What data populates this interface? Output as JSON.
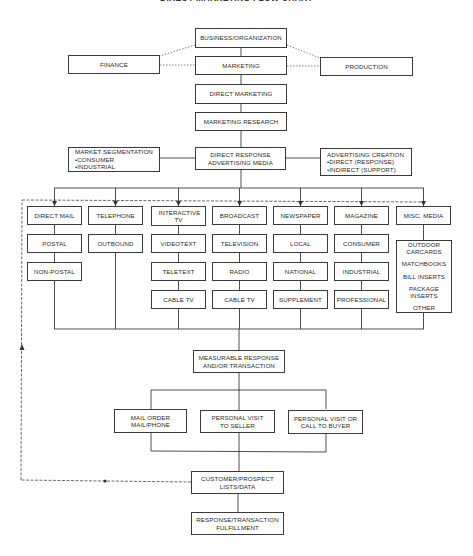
{
  "title": "DIRECT MARKETING FLOW CHART",
  "top_chain": {
    "business": "BUSINESS/ORGANIZATION",
    "finance": "FINANCE",
    "marketing": "MARKETING",
    "production": "PRODUCTION",
    "direct_marketing": "DIRECT MARKETING",
    "marketing_research": "MARKETING RESEARCH"
  },
  "media_row": {
    "center_line1": "DIRECT RESPONSE",
    "center_line2": "ADVERTISING MEDIA",
    "segmentation": {
      "title": "MARKET SEGMENTATION",
      "items": [
        "CONSUMER",
        "INDUSTRIAL"
      ]
    },
    "creation": {
      "title": "ADVERTISING CREATION",
      "items": [
        "DIRECT (RESPONSE)",
        "INDIRECT (SUPPORT)"
      ]
    }
  },
  "columns": [
    {
      "name": "DIRECT MAIL",
      "children": [
        "POSTAL",
        "NON-POSTAL"
      ]
    },
    {
      "name": "TELEPHONE",
      "children": [
        "OUTBOUND"
      ]
    },
    {
      "name": "INTERACTIVE TV",
      "children": [
        "VIDEOTEXT",
        "TELETEXT",
        "CABLE TV"
      ]
    },
    {
      "name": "BROADCAST",
      "children": [
        "TELEVISION",
        "RADIO",
        "CABLE TV"
      ]
    },
    {
      "name": "NEWSPAPER",
      "children": [
        "LOCAL",
        "NATIONAL",
        "SUPPLEMENT"
      ]
    },
    {
      "name": "MAGAZINE",
      "children": [
        "CONSUMER",
        "INDUSTRIAL",
        "PROFESSIONAL"
      ]
    },
    {
      "name": "MISC. MEDIA",
      "children": [
        "OUTDOOR CARCARDS",
        "MATCHBOOKS",
        "BILL INSERTS",
        "PACKAGE INSERTS",
        "OTHER"
      ]
    }
  ],
  "response": {
    "line1": "MEASURABLE RESPONSE",
    "line2": "AND/OR TRANSACTION"
  },
  "channels": [
    {
      "line1": "MAIL ORDER",
      "line2": "MAIL/PHONE"
    },
    {
      "line1": "PERSONAL VISIT",
      "line2": "TO SELLER"
    },
    {
      "line1": "PERSONAL VISIT OR",
      "line2": "CALL TO BUYER"
    }
  ],
  "customer_lists": {
    "line1": "CUSTOMER/PROSPECT",
    "line2": "LISTS/DATA"
  },
  "fulfillment": {
    "line1": "RESPONSE/TRANSACTION",
    "line2": "FULFILLMENT"
  }
}
